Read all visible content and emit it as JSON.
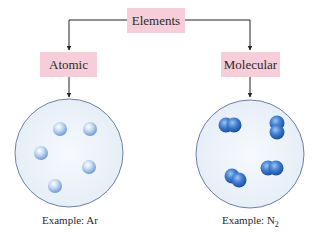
{
  "diagram": {
    "root": {
      "label": "Elements"
    },
    "branches": [
      {
        "label": "Atomic",
        "example_prefix": "Example: ",
        "example_formula": "Ar",
        "example_subscript": "",
        "particle_type": "single-atom",
        "particle_count": 5
      },
      {
        "label": "Molecular",
        "example_prefix": "Example: ",
        "example_formula": "N",
        "example_subscript": "2",
        "particle_type": "diatomic-molecule",
        "particle_count": 4
      }
    ],
    "colors": {
      "box_fill": "#f6cdd9",
      "circle_fill": "#eef4fa",
      "circle_stroke": "#6f7fa6",
      "atom_color": "#9fbfe6",
      "molecule_color": "#3f7ed0",
      "line_color": "#222222"
    }
  }
}
